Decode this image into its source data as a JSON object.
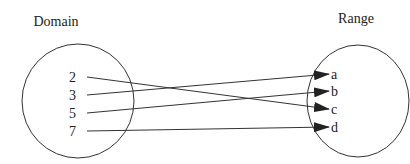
{
  "domain_set": {
    "title": "Domain",
    "elements": [
      "2",
      "3",
      "5",
      "7"
    ]
  },
  "range_set": {
    "title": "Range",
    "elements": [
      "a",
      "b",
      "c",
      "d"
    ]
  },
  "mappings": [
    {
      "from": "2",
      "to": "c"
    },
    {
      "from": "3",
      "to": "a"
    },
    {
      "from": "5",
      "to": "b"
    },
    {
      "from": "7",
      "to": "d"
    }
  ],
  "colors": {
    "stroke": "#333333",
    "text": "#222222"
  }
}
